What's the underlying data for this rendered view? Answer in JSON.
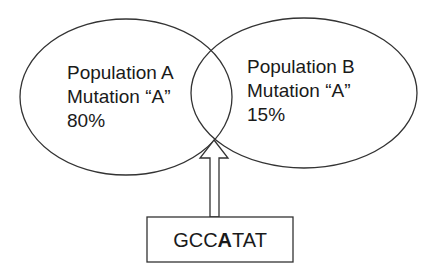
{
  "diagram": {
    "populations": [
      {
        "name": "Population A",
        "mutation": "Mutation “A”",
        "frequency": "80%"
      },
      {
        "name": "Population B",
        "mutation": "Mutation “A”",
        "frequency": "15%"
      }
    ],
    "sequence": {
      "prefix": "GCC",
      "highlight": "A",
      "suffix": "TAT"
    },
    "colors": {
      "stroke": "#333333",
      "text": "#1a1a1a",
      "background": "#ffffff"
    }
  }
}
